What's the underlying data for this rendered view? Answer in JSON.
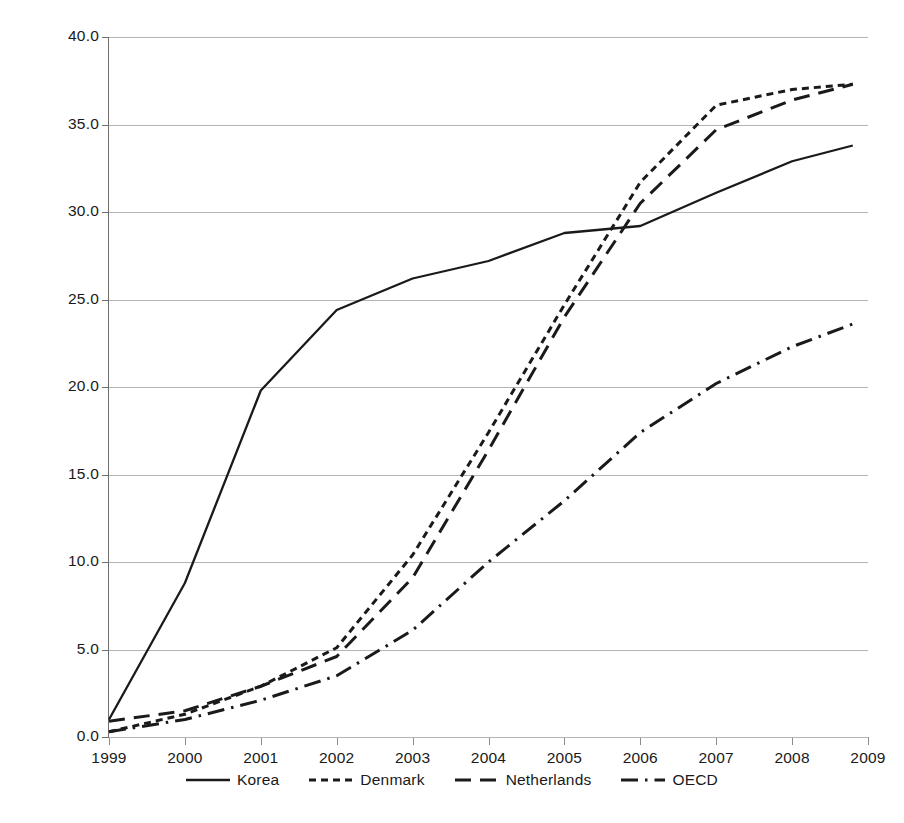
{
  "chart_data": {
    "type": "line",
    "title": "",
    "subtitle": "",
    "xlabel": "",
    "ylabel": "",
    "xlim": [
      1999,
      2009
    ],
    "ylim": [
      0.0,
      40.0
    ],
    "grid": true,
    "legend_position": "bottom",
    "x": [
      1999,
      2000,
      2001,
      2002,
      2003,
      2004,
      2005,
      2006,
      2007,
      2008,
      2008.8
    ],
    "categories": [
      "1999",
      "2000",
      "2001",
      "2002",
      "2003",
      "2004",
      "2005",
      "2006",
      "2007",
      "2008",
      "2009"
    ],
    "xtick_labels": [
      "1999",
      "2000",
      "2001",
      "2002",
      "2003",
      "2004",
      "2005",
      "2006",
      "2007",
      "2008",
      "2009"
    ],
    "ytick_labels": [
      "0.0",
      "5.0",
      "10.0",
      "15.0",
      "20.0",
      "25.0",
      "30.0",
      "35.0",
      "40.0"
    ],
    "ytick_values": [
      0.0,
      5.0,
      10.0,
      15.0,
      20.0,
      25.0,
      30.0,
      35.0,
      40.0
    ],
    "series": [
      {
        "name": "Korea",
        "style": "solid",
        "color": "#1a1a1a",
        "values": [
          1.0,
          8.8,
          19.8,
          24.4,
          26.2,
          27.2,
          28.8,
          29.2,
          31.1,
          32.9,
          33.8
        ]
      },
      {
        "name": "Denmark",
        "style": "dotted",
        "color": "#1a1a1a",
        "values": [
          0.3,
          1.3,
          2.9,
          5.1,
          10.4,
          17.4,
          24.7,
          31.7,
          36.1,
          37.0,
          37.3
        ]
      },
      {
        "name": "Netherlands",
        "style": "dashed",
        "color": "#1a1a1a",
        "values": [
          0.9,
          1.5,
          2.9,
          4.6,
          9.1,
          16.4,
          24.0,
          30.5,
          34.7,
          36.4,
          37.3
        ]
      },
      {
        "name": "OECD",
        "style": "dash-dot",
        "color": "#1a1a1a",
        "values": [
          0.3,
          1.0,
          2.1,
          3.5,
          6.1,
          10.0,
          13.5,
          17.4,
          20.2,
          22.3,
          23.6
        ]
      }
    ]
  },
  "legend": {
    "entries": [
      {
        "label": "Korea",
        "style": "solid"
      },
      {
        "label": "Denmark",
        "style": "dotted"
      },
      {
        "label": "Netherlands",
        "style": "dashed"
      },
      {
        "label": "OECD",
        "style": "dash-dot"
      }
    ]
  },
  "axes": {
    "y": {
      "min": 0.0,
      "max": 40.0,
      "step": 5.0
    },
    "x": {
      "min": 1999,
      "max": 2009,
      "step": 1
    }
  },
  "colors": {
    "line": "#1a1a1a",
    "grid": "#b4b4b4",
    "axis": "#6e6e6e",
    "background": "#ffffff"
  }
}
